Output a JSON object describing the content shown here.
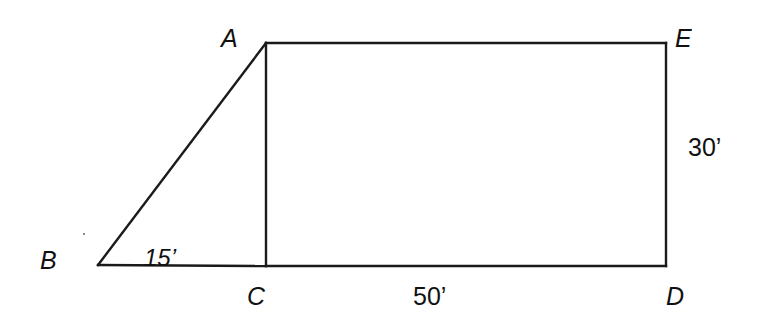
{
  "diagram": {
    "type": "geometry-figure",
    "stroke_color": "#1a1a1a",
    "points": {
      "A": {
        "label": "A",
        "x": 266,
        "y": 43
      },
      "B": {
        "label": "B",
        "x": 98,
        "y": 265
      },
      "C": {
        "label": "C",
        "x": 266,
        "y": 266
      },
      "D": {
        "label": "D",
        "x": 666,
        "y": 266
      },
      "E": {
        "label": "E",
        "x": 666,
        "y": 43
      }
    },
    "segments": [
      {
        "from": "A",
        "to": "B"
      },
      {
        "from": "B",
        "to": "C"
      },
      {
        "from": "A",
        "to": "C"
      },
      {
        "from": "A",
        "to": "E"
      },
      {
        "from": "E",
        "to": "D"
      },
      {
        "from": "C",
        "to": "D"
      }
    ],
    "dimensions": {
      "BC": "15’",
      "CD": "50’",
      "DE": "30’"
    }
  }
}
